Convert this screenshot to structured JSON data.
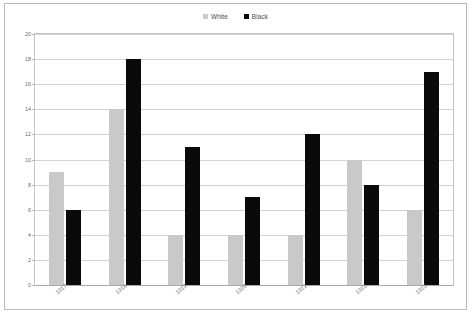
{
  "legend": {
    "position": "top-center",
    "entries": [
      {
        "label": "White",
        "color": "#c9c9c9",
        "marker": "square-swatch"
      },
      {
        "label": "Black",
        "color": "#0a0a0a",
        "marker": "square-swatch"
      }
    ]
  },
  "axes": {
    "y_ticks": [
      "20",
      "18",
      "16",
      "14",
      "12",
      "10",
      "8",
      "6",
      "4",
      "2",
      "0"
    ],
    "x_ticks": [
      "1917",
      "1918",
      "1919",
      "1920",
      "1921",
      "1922",
      "1923"
    ]
  },
  "caption": {
    "text": ""
  },
  "chart_data": {
    "type": "bar",
    "title": "",
    "subtitle": "",
    "xlabel": "",
    "ylabel": "",
    "categories": [
      "1917",
      "1918",
      "1919",
      "1920",
      "1921",
      "1922",
      "1923"
    ],
    "series": [
      {
        "name": "White",
        "color": "#c9c9c9",
        "values": [
          9,
          14,
          4,
          4,
          4,
          10,
          6
        ]
      },
      {
        "name": "Black",
        "color": "#0a0a0a",
        "values": [
          6,
          18,
          11,
          7,
          12,
          8,
          17
        ]
      }
    ],
    "ylim": [
      0,
      20
    ],
    "ytick_step": 2,
    "grid": true,
    "grid_axis": "y",
    "legend_position": "top-center",
    "bar_layout": "grouped",
    "xtick_rotation": -40
  }
}
